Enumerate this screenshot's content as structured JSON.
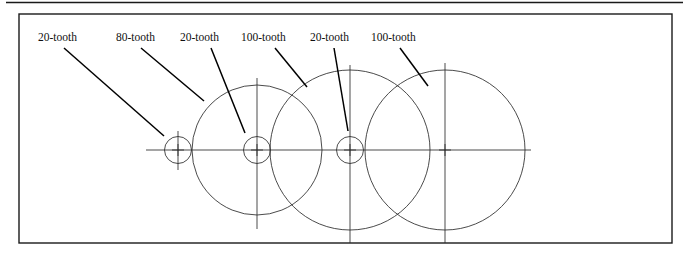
{
  "figure": {
    "caption_labels": [
      {
        "id": "label-1",
        "text": "20-tooth",
        "x": 38,
        "y": 41
      },
      {
        "id": "label-2",
        "text": "80-tooth",
        "x": 116,
        "y": 41
      },
      {
        "id": "label-3",
        "text": "20-tooth",
        "x": 180,
        "y": 41
      },
      {
        "id": "label-4",
        "text": "100-tooth",
        "x": 241,
        "y": 41
      },
      {
        "id": "label-5",
        "text": "20-tooth",
        "x": 310,
        "y": 41
      },
      {
        "id": "label-6",
        "text": "100-tooth",
        "x": 371,
        "y": 41
      }
    ],
    "leader_lines": [
      {
        "id": "leader-1",
        "x1": 64,
        "y1": 48,
        "x2": 164,
        "y2": 136
      },
      {
        "id": "leader-2",
        "x1": 141,
        "y1": 48,
        "x2": 204,
        "y2": 101
      },
      {
        "id": "leader-3",
        "x1": 211,
        "y1": 48,
        "x2": 245,
        "y2": 133
      },
      {
        "id": "leader-4",
        "x1": 275,
        "y1": 48,
        "x2": 307,
        "y2": 87
      },
      {
        "id": "leader-5",
        "x1": 334,
        "y1": 48,
        "x2": 348,
        "y2": 131
      },
      {
        "id": "leader-6",
        "x1": 400,
        "y1": 48,
        "x2": 428,
        "y2": 86
      }
    ],
    "gears": [
      {
        "id": "gear-1",
        "teeth": "20-tooth",
        "cx": 178,
        "cy": 150,
        "r": 13.5,
        "hub": false
      },
      {
        "id": "gear-2",
        "teeth": "80-tooth",
        "cx": 257,
        "cy": 150,
        "r": 65,
        "hub": true,
        "hub_r": 13.5
      },
      {
        "id": "gear-3",
        "teeth": "100-tooth",
        "cx": 350,
        "cy": 150,
        "r": 80,
        "hub": true,
        "hub_r": 13.5
      },
      {
        "id": "gear-4",
        "teeth": "100-tooth",
        "cx": 445,
        "cy": 150,
        "r": 80,
        "hub": false
      }
    ],
    "axis": {
      "y": 150,
      "x1": 146,
      "x2": 531
    },
    "center_lines": [
      {
        "id": "centerline-gear-1",
        "x": 178,
        "y1": 131,
        "y2": 170
      },
      {
        "id": "centerline-gear-2",
        "x": 257,
        "y1": 78,
        "y2": 229
      },
      {
        "id": "centerline-gear-3",
        "x": 350,
        "y1": 65,
        "y2": 243
      },
      {
        "id": "centerline-gear-4",
        "x": 445,
        "y1": 63,
        "y2": 243
      }
    ],
    "frame": {
      "x": 19,
      "y": 14,
      "width": 653,
      "height": 229
    },
    "top_rule": {
      "x1": 6,
      "y1": 2.5,
      "x2": 683,
      "y2": 2.5
    },
    "colors": {
      "ink": "#1a1a1a",
      "line": "#2b2b2b",
      "leader": "#000000",
      "background": "#ffffff"
    }
  }
}
